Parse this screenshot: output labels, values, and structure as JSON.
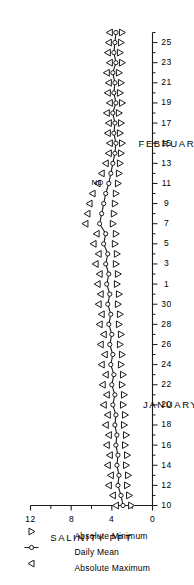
{
  "figure": {
    "orientation": "rotated-90",
    "background": "#ffffff",
    "ink": "#1a1a1a"
  },
  "legend": {
    "position": "top-left",
    "items": [
      {
        "label": "Absolute Maximum",
        "symbol": "triangle-left",
        "name": "legend-abs-max"
      },
      {
        "label": "Daily Mean",
        "symbol": "circle-with-line",
        "name": "legend-daily-mean"
      },
      {
        "label": "Absolute Minimum",
        "symbol": "triangle-left",
        "name": "legend-abs-min"
      }
    ]
  },
  "annotations": [
    {
      "text": "ND",
      "meaning": "no data",
      "x_day_index": 33,
      "y_value": 4.1
    }
  ],
  "chart_data": {
    "type": "line",
    "title": "",
    "subtitle": "",
    "xlabel_segments": [
      "JANUARY 1976",
      "FEBRUARY 1976"
    ],
    "ylabel": "SALINITY PPT",
    "ylim": [
      0,
      12
    ],
    "yticks": [
      0,
      4,
      8,
      12
    ],
    "ytick_labels": [
      "0",
      "4",
      "8",
      "12"
    ],
    "grid": false,
    "legend_position": "top-left",
    "x": [
      "Jan 10",
      "Jan 11",
      "Jan 12",
      "Jan 13",
      "Jan 14",
      "Jan 15",
      "Jan 16",
      "Jan 17",
      "Jan 18",
      "Jan 19",
      "Jan 20",
      "Jan 21",
      "Jan 22",
      "Jan 23",
      "Jan 24",
      "Jan 25",
      "Jan 26",
      "Jan 27",
      "Jan 28",
      "Jan 29",
      "Jan 30",
      "Jan 31",
      "Feb 1",
      "Feb 2",
      "Feb 3",
      "Feb 4",
      "Feb 5",
      "Feb 6",
      "Feb 7",
      "Feb 8",
      "Feb 9",
      "Feb 10",
      "Feb 11",
      "Feb 12",
      "Feb 13",
      "Feb 14",
      "Feb 15",
      "Feb 16",
      "Feb 17",
      "Feb 18",
      "Feb 19",
      "Feb 20",
      "Feb 21",
      "Feb 22",
      "Feb 23",
      "Feb 24",
      "Feb 25",
      "Feb 26"
    ],
    "xticks_january": [
      10,
      12,
      14,
      16,
      18,
      20,
      22,
      24,
      26,
      28,
      30
    ],
    "xticks_february": [
      1,
      3,
      5,
      7,
      9,
      11,
      13,
      15,
      17,
      19,
      21,
      23,
      25
    ],
    "series": [
      {
        "name": "Absolute Maximum",
        "symbol": "triangle-left",
        "values": [
          3.6,
          3.9,
          4.3,
          4.1,
          4.4,
          4.2,
          4.5,
          4.3,
          4.6,
          4.4,
          4.8,
          4.5,
          4.9,
          4.6,
          5.0,
          4.7,
          5.1,
          4.8,
          5.2,
          5.0,
          5.3,
          5.1,
          5.4,
          5.2,
          5.6,
          5.3,
          5.8,
          5.5,
          6.6,
          6.4,
          6.2,
          5.9,
          5.4,
          5.0,
          4.6,
          4.3,
          4.2,
          4.4,
          4.3,
          4.5,
          4.2,
          4.4,
          4.3,
          4.5,
          4.2,
          4.4,
          4.3,
          4.2
        ]
      },
      {
        "name": "Daily Mean",
        "symbol": "circle",
        "values": [
          2.9,
          3.1,
          3.4,
          3.3,
          3.5,
          3.4,
          3.6,
          3.5,
          3.7,
          3.6,
          3.9,
          3.7,
          4.0,
          3.8,
          4.1,
          3.9,
          4.2,
          4.0,
          4.3,
          4.1,
          4.4,
          4.2,
          4.5,
          4.3,
          4.6,
          4.4,
          4.8,
          4.6,
          5.2,
          5.0,
          4.8,
          4.6,
          4.3,
          4.1,
          3.9,
          3.7,
          3.6,
          3.8,
          3.7,
          3.9,
          3.6,
          3.8,
          3.7,
          3.9,
          3.6,
          3.8,
          3.7,
          3.6
        ]
      },
      {
        "name": "Absolute Minimum",
        "symbol": "triangle-left",
        "values": [
          2.1,
          2.3,
          2.5,
          2.4,
          2.6,
          2.5,
          2.7,
          2.6,
          2.8,
          2.7,
          2.9,
          2.8,
          3.0,
          2.9,
          3.1,
          3.0,
          3.2,
          3.1,
          3.3,
          3.2,
          3.4,
          3.3,
          3.5,
          3.4,
          3.6,
          3.5,
          3.7,
          3.6,
          3.9,
          3.8,
          3.7,
          3.6,
          3.4,
          3.3,
          3.2,
          3.1,
          3.0,
          3.2,
          3.1,
          3.3,
          3.0,
          3.2,
          3.1,
          3.3,
          3.0,
          3.2,
          3.1,
          3.0
        ]
      }
    ]
  }
}
